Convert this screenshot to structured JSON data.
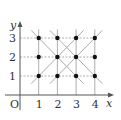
{
  "axes": {
    "x_label": "x",
    "y_label": "y",
    "origin_label": "O",
    "x_ticks": [
      "1",
      "2",
      "3",
      "4"
    ],
    "y_ticks": [
      "1",
      "2",
      "3"
    ]
  },
  "points": [
    [
      1,
      1
    ],
    [
      2,
      1
    ],
    [
      3,
      1
    ],
    [
      4,
      1
    ],
    [
      1,
      2
    ],
    [
      2,
      2
    ],
    [
      3,
      2
    ],
    [
      4,
      2
    ],
    [
      1,
      3
    ],
    [
      2,
      3
    ],
    [
      3,
      3
    ],
    [
      4,
      3
    ]
  ],
  "diagonal_lines": [
    {
      "from": [
        0.6,
        3.4
      ],
      "to": [
        3.4,
        0.6
      ]
    },
    {
      "from": [
        1.6,
        3.4
      ],
      "to": [
        4.4,
        0.6
      ]
    },
    {
      "from": [
        0.6,
        0.6
      ],
      "to": [
        3.4,
        3.4
      ]
    },
    {
      "from": [
        1.6,
        0.6
      ],
      "to": [
        4.4,
        3.4
      ]
    }
  ],
  "colors": {
    "axis": "#555555",
    "grid": "#999999",
    "diag": "#aaaaaa",
    "point": "#111111"
  }
}
